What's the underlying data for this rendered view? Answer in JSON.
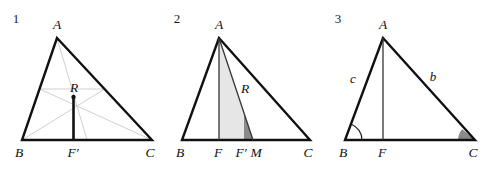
{
  "figure": {
    "background_color": "#ffffff",
    "width": 496,
    "height": 172
  },
  "style": {
    "outline_color": "#111111",
    "outline_width": 2.4,
    "median_color": "#c9c9c9",
    "median_width": 0.9,
    "bold_segment_color": "#111111",
    "bold_segment_width": 2.6,
    "thin_line_color": "#333333",
    "thin_line_width": 1.3,
    "light_fill": "#e6e6e6",
    "dark_fill": "#8a8a8a",
    "arc_color": "#222222"
  },
  "panels": [
    {
      "id": "panel-1",
      "number": "1",
      "number_pos": {
        "x": 16,
        "y": 23
      },
      "points": {
        "A": {
          "x": 57,
          "y": 38
        },
        "B": {
          "x": 22,
          "y": 140
        },
        "C": {
          "x": 152,
          "y": 140
        },
        "R": {
          "x": 73,
          "y": 97
        },
        "Fprime": {
          "x": 74,
          "y": 140
        },
        "midAB": {
          "x": 39.5,
          "y": 89
        },
        "midAC": {
          "x": 104.5,
          "y": 89
        },
        "midBC": {
          "x": 87,
          "y": 140
        }
      },
      "labels": [
        {
          "name": "vertex-label-a",
          "text": "A",
          "x": 57,
          "y": 29
        },
        {
          "name": "vertex-label-b",
          "text": "B",
          "x": 19,
          "y": 157
        },
        {
          "name": "vertex-label-c",
          "text": "C",
          "x": 150,
          "y": 157
        },
        {
          "name": "vertex-label-r",
          "text": "R",
          "x": 74,
          "y": 92
        },
        {
          "name": "vertex-label-f-prime",
          "text": "F′",
          "x": 73,
          "y": 157
        }
      ]
    },
    {
      "id": "panel-2",
      "number": "2",
      "number_pos": {
        "x": 177,
        "y": 23
      },
      "points": {
        "A": {
          "x": 219,
          "y": 38
        },
        "B": {
          "x": 182,
          "y": 140
        },
        "C": {
          "x": 310,
          "y": 140
        },
        "F": {
          "x": 219,
          "y": 140
        },
        "Fprime": {
          "x": 244,
          "y": 140
        },
        "M": {
          "x": 253,
          "y": 140
        },
        "R": {
          "x": 238,
          "y": 97
        }
      },
      "labels": [
        {
          "name": "vertex-label-a",
          "text": "A",
          "x": 219,
          "y": 29
        },
        {
          "name": "vertex-label-b",
          "text": "B",
          "x": 180,
          "y": 157
        },
        {
          "name": "vertex-label-c",
          "text": "C",
          "x": 308,
          "y": 157
        },
        {
          "name": "vertex-label-f",
          "text": "F",
          "x": 218,
          "y": 157
        },
        {
          "name": "vertex-label-f-prime",
          "text": "F′",
          "x": 240,
          "y": 157
        },
        {
          "name": "vertex-label-m",
          "text": "M",
          "x": 254,
          "y": 157
        },
        {
          "name": "vertex-label-r",
          "text": "R",
          "x": 243,
          "y": 93
        }
      ]
    },
    {
      "id": "panel-3",
      "number": "3",
      "number_pos": {
        "x": 338,
        "y": 23
      },
      "points": {
        "A": {
          "x": 383,
          "y": 38
        },
        "B": {
          "x": 345,
          "y": 140
        },
        "C": {
          "x": 475,
          "y": 140
        },
        "F": {
          "x": 383,
          "y": 140
        }
      },
      "labels": [
        {
          "name": "vertex-label-a",
          "text": "A",
          "x": 383,
          "y": 29
        },
        {
          "name": "vertex-label-b",
          "text": "B",
          "x": 343,
          "y": 157
        },
        {
          "name": "vertex-label-c",
          "text": "C",
          "x": 473,
          "y": 157
        },
        {
          "name": "vertex-label-f",
          "text": "F",
          "x": 382,
          "y": 157
        },
        {
          "name": "side-label-c",
          "text": "c",
          "x": 353,
          "y": 83
        },
        {
          "name": "side-label-b",
          "text": "b",
          "x": 433,
          "y": 81
        }
      ],
      "angle_marks": [
        {
          "name": "angle-arc-b",
          "at": "B",
          "radius": 17,
          "filled": false
        },
        {
          "name": "angle-arc-c",
          "at": "C",
          "radius": 17,
          "filled": true
        }
      ]
    }
  ]
}
